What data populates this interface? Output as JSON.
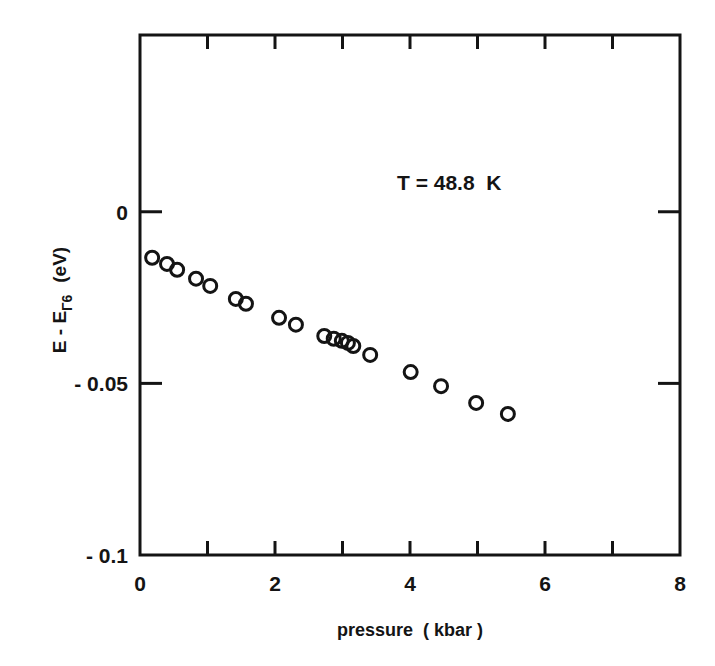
{
  "chart_data": {
    "type": "scatter",
    "title": "",
    "annotation": "T = 48.8  K",
    "xlabel": "pressure  ( kbar )",
    "ylabel": "E - E",
    "ylabel_subscript": "Γ6",
    "ylabel_unit": "(eV)",
    "xlim": [
      0,
      8
    ],
    "ylim": [
      -0.1,
      0.0515
    ],
    "grid": false,
    "legend": null,
    "x_ticks": [
      0,
      2,
      4,
      6,
      8
    ],
    "x_tick_labels": [
      "0",
      "2",
      "4",
      "6",
      "8"
    ],
    "x_minor_ticks": [
      1,
      3,
      5,
      7
    ],
    "y_ticks": [
      0,
      -0.05,
      -0.1
    ],
    "y_tick_labels": [
      "0",
      "- 0.05",
      "- 0.1"
    ],
    "marker": "open-circle",
    "series": [
      {
        "name": "T = 48.8 K",
        "x": [
          0.18,
          0.4,
          0.55,
          0.83,
          1.04,
          1.42,
          1.57,
          2.06,
          2.31,
          2.73,
          2.87,
          2.99,
          3.08,
          3.16,
          3.41,
          4.01,
          4.46,
          4.98,
          5.45
        ],
        "y": [
          -0.0134,
          -0.0152,
          -0.0169,
          -0.0195,
          -0.0216,
          -0.0254,
          -0.0268,
          -0.0309,
          -0.0329,
          -0.0362,
          -0.037,
          -0.0376,
          -0.0382,
          -0.0391,
          -0.0417,
          -0.0467,
          -0.0508,
          -0.0557,
          -0.0589
        ]
      }
    ]
  }
}
